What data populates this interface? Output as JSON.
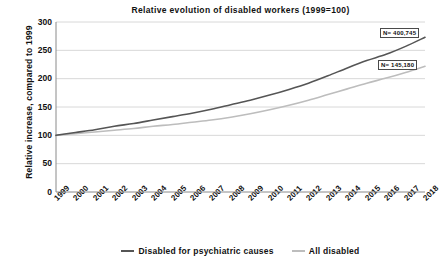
{
  "chart_data": {
    "type": "line",
    "title": "Relative evolution of disabled workers (1999=100)",
    "xlabel": "",
    "ylabel": "Relative increase, compared to 1999",
    "ylim": [
      0,
      300
    ],
    "yticks": [
      0,
      50,
      100,
      150,
      200,
      250,
      300
    ],
    "grid": true,
    "legend_position": "bottom",
    "categories": [
      "1999",
      "2000",
      "2001",
      "2002",
      "2003",
      "2004",
      "2005",
      "2006",
      "2007",
      "2008",
      "2009",
      "2010",
      "2011",
      "2012",
      "2013",
      "2014",
      "2015",
      "2016",
      "2017",
      "2018"
    ],
    "series": [
      {
        "name": "Disabled for psychiatric causes",
        "color": "#555555",
        "values": [
          100,
          105,
          110,
          116,
          121,
          127,
          133,
          139,
          146,
          154,
          162,
          171,
          181,
          192,
          205,
          219,
          232,
          243,
          257,
          273
        ],
        "end_annotation": "N= 400,745"
      },
      {
        "name": "All disabled",
        "color": "#bdbdbd",
        "values": [
          100,
          103,
          106,
          109,
          112,
          116,
          119,
          123,
          127,
          132,
          138,
          145,
          153,
          162,
          172,
          182,
          192,
          201,
          211,
          222
        ],
        "end_annotation": "N= 145,180"
      }
    ]
  },
  "annotations": [
    {
      "text": "N= 400,745"
    },
    {
      "text": "N= 145,180"
    }
  ],
  "legend": {
    "items": [
      {
        "label": "Disabled for psychiatric causes",
        "color": "#555555"
      },
      {
        "label": "All disabled",
        "color": "#bdbdbd"
      }
    ]
  },
  "axes": {
    "frame_color": "#8a8a8a",
    "grid_color": "#d8d8d8"
  }
}
